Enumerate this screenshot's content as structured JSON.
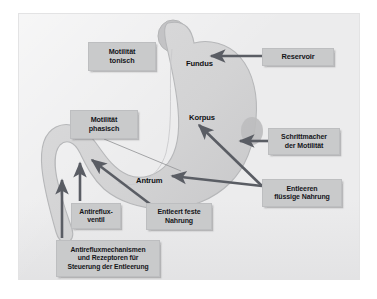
{
  "figure": {
    "title_alt": "Magen Funktionsdiagramm",
    "background_color": "#ececed",
    "organ_fill": "#d4d4d5",
    "organ_stroke": "#b9babb",
    "pacemaker_fill": "#b9babb",
    "label_fill": "#c9cacb",
    "arrow_color": "#5a5d64",
    "text_color": "#15161a"
  },
  "organ_labels": [
    {
      "id": "fundus",
      "text": "Fundus",
      "x": 186,
      "y": 59,
      "size": 7.6
    },
    {
      "id": "korpus",
      "text": "Korpus",
      "x": 189,
      "y": 113,
      "size": 7.6
    },
    {
      "id": "antrum",
      "text": "Antrum",
      "x": 136,
      "y": 176,
      "size": 7.6
    }
  ],
  "callouts": [
    {
      "id": "motilitaet-tonisch",
      "text": "Motilität\ntonisch",
      "x": 88,
      "y": 42,
      "w": 68,
      "h": 29,
      "size": 7.2
    },
    {
      "id": "reservoir",
      "text": "Reservoir",
      "x": 262,
      "y": 48,
      "w": 72,
      "h": 18,
      "size": 7.4
    },
    {
      "id": "motilitaet-phasisch",
      "text": "Motilität\nphasisch",
      "x": 70,
      "y": 110,
      "w": 68,
      "h": 29,
      "size": 7.2
    },
    {
      "id": "schrittmacher-der-motilitaet",
      "text": "Schrittmacher\nder Motilität",
      "x": 268,
      "y": 128,
      "w": 72,
      "h": 27,
      "size": 7.0
    },
    {
      "id": "entleeren-fluessige-nahrung",
      "text": "Entleeren\nflüssige Nahrung",
      "x": 262,
      "y": 179,
      "w": 80,
      "h": 28,
      "size": 7.0
    },
    {
      "id": "antirefluxventil",
      "text": "Antireflux-\nventil",
      "x": 71,
      "y": 203,
      "w": 50,
      "h": 26,
      "size": 6.9
    },
    {
      "id": "entleert-feste-nahrung",
      "text": "Entleert feste\nNahrung",
      "x": 146,
      "y": 203,
      "w": 66,
      "h": 27,
      "size": 7.0
    },
    {
      "id": "antirefluxmechanismen",
      "text": "Antirefluxmechanismen\nund Rezeptoren für\nSteuerung der Entleerung",
      "x": 56,
      "y": 240,
      "w": 104,
      "h": 37,
      "size": 6.8
    }
  ],
  "arrows": [
    {
      "id": "arrow-reservoir-to-fundus",
      "from": [
        262,
        56
      ],
      "to": [
        211,
        56
      ]
    },
    {
      "id": "arrow-schrittmacher-to-pacemaker",
      "from": [
        268,
        141
      ],
      "to": [
        240,
        141
      ]
    },
    {
      "id": "arrow-entleeren-to-korpus",
      "from": [
        262,
        186
      ],
      "to": [
        199,
        125
      ]
    },
    {
      "id": "arrow-entleeren-to-antrum",
      "from": [
        262,
        186
      ],
      "to": [
        172,
        176
      ]
    },
    {
      "id": "arrow-entleert-feste-to-duodenum",
      "from": [
        150,
        204
      ],
      "to": [
        92,
        160
      ]
    },
    {
      "id": "arrow-antirefluxventil-up",
      "from": [
        80,
        201
      ],
      "to": [
        80,
        163
      ]
    },
    {
      "id": "arrow-antirefluxmechanismen-up",
      "from": [
        62,
        238
      ],
      "to": [
        62,
        180
      ]
    }
  ],
  "leader_lines": [
    {
      "id": "leader-phasisch-to-corpus",
      "from": [
        104,
        139
      ],
      "to": [
        181,
        171
      ]
    }
  ],
  "chart_data": {
    "type": "diagram",
    "regions": [
      "Fundus",
      "Korpus",
      "Antrum"
    ],
    "annotations": [
      "Motilität tonisch",
      "Reservoir",
      "Motilität phasisch",
      "Schrittmacher der Motilität",
      "Entleeren flüssige Nahrung",
      "Antirefluxventil",
      "Entleert feste Nahrung",
      "Antirefluxmechanismen und Rezeptoren für Steuerung der Entleerung"
    ]
  }
}
